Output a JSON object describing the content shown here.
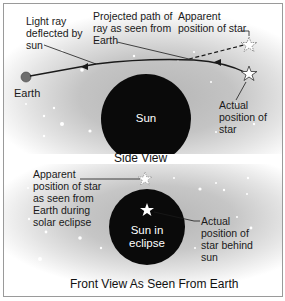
{
  "side_view": {
    "caption": "Side View",
    "labels": {
      "light_ray_line1": "Light ray",
      "light_ray_line2": "deflected by",
      "light_ray_line3": "sun",
      "projected_line1": "Projected path of",
      "projected_line2": "ray as seen from",
      "projected_line3": "Earth",
      "apparent_line1": "Apparent",
      "apparent_line2": "position of star",
      "earth": "Earth",
      "sun": "Sun",
      "actual_line1": "Actual",
      "actual_line2": "position of",
      "actual_line3": "star"
    }
  },
  "front_view": {
    "caption": "Front View As Seen From Earth",
    "labels": {
      "apparent_line1": "Apparent",
      "apparent_line2": "position of star",
      "apparent_line3": "as seen from",
      "apparent_line4": "Earth during",
      "apparent_line5": "solar eclipse",
      "sun_line1": "Sun in",
      "sun_line2": "eclipse",
      "actual_line1": "Actual",
      "actual_line2": "position of",
      "actual_line3": "star behind",
      "actual_line4": "sun"
    }
  },
  "colors": {
    "sun": "#0a0a0a",
    "earth": "#6e6e6e",
    "background_inner": "#b5b5b5",
    "line": "#1a1a1a"
  }
}
